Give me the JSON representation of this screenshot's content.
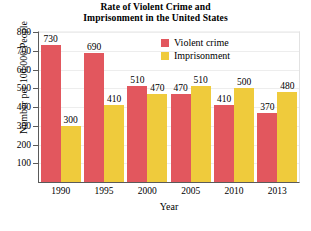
{
  "chart_data": {
    "type": "bar",
    "title": "Rate of Violent Crime and Imprisonment in the United States",
    "title_lines": [
      "Rate of Violent Crime and",
      "Imprisonment in the United States"
    ],
    "xlabel": "Year",
    "ylabel": "Number per 100,000 People",
    "categories": [
      "1990",
      "1995",
      "2000",
      "2005",
      "2010",
      "2013"
    ],
    "series": [
      {
        "name": "Violent crime",
        "color": "#e2575e",
        "values": [
          730,
          690,
          510,
          470,
          410,
          370
        ]
      },
      {
        "name": "Imprisonment",
        "color": "#efcb3c",
        "values": [
          300,
          410,
          470,
          510,
          500,
          480
        ]
      }
    ],
    "ylim": [
      0,
      800
    ],
    "yticks": [
      100,
      200,
      300,
      400,
      500,
      600,
      700,
      800
    ],
    "grid": true,
    "legend_position": "top-right"
  },
  "axis": {
    "y_ticks": [
      "800",
      "700",
      "600",
      "500",
      "400",
      "300",
      "200",
      "100"
    ],
    "x_ticks": [
      "1990",
      "1995",
      "2000",
      "2005",
      "2010",
      "2013"
    ],
    "y_title": "Number per 100,000 People",
    "x_title": "Year"
  },
  "legend": {
    "items": [
      {
        "label": "Violent crime",
        "color": "#e2575e"
      },
      {
        "label": "Imprisonment",
        "color": "#efcb3c"
      }
    ]
  },
  "values_flat": {
    "violent_1990": "730",
    "prison_1990": "300",
    "violent_1995": "690",
    "prison_1995": "410",
    "violent_2000": "510",
    "prison_2000": "470",
    "violent_2005": "470",
    "prison_2005": "510",
    "violent_2010": "410",
    "prison_2010": "500",
    "violent_2013": "370",
    "prison_2013": "480"
  }
}
